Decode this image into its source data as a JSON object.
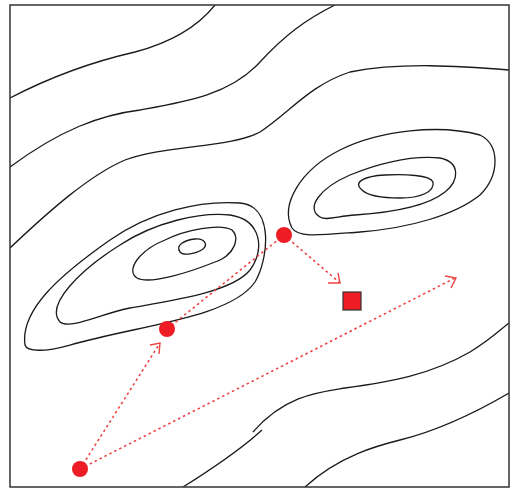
{
  "diagram": {
    "type": "contour-optimization-path",
    "frame": {
      "x": 10,
      "y": 5,
      "width": 499,
      "height": 482,
      "stroke": "#333333"
    },
    "colors": {
      "contour": "#1a1a1a",
      "point": "#ee1c25",
      "path": "#ee4444",
      "target_fill": "#ee1c25",
      "target_stroke": "#333333"
    },
    "points": [
      {
        "id": "start",
        "x": 80,
        "y": 469
      },
      {
        "id": "step-1",
        "x": 167,
        "y": 329
      },
      {
        "id": "step-2",
        "x": 284,
        "y": 235
      }
    ],
    "target": {
      "x": 352,
      "y": 301,
      "size": 18
    },
    "arrows": [
      {
        "id": "start-to-step-1",
        "x1": 80,
        "y1": 469,
        "x2": 160,
        "y2": 343,
        "head": true
      },
      {
        "id": "step-1-to-step-2",
        "x1": 167,
        "y1": 329,
        "x2": 284,
        "y2": 235,
        "head": false
      },
      {
        "id": "step-2-to-target",
        "x1": 284,
        "y1": 235,
        "x2": 340,
        "y2": 283,
        "head": true
      },
      {
        "id": "start-long-step",
        "x1": 80,
        "y1": 469,
        "x2": 455,
        "y2": 278,
        "head": true
      }
    ]
  }
}
